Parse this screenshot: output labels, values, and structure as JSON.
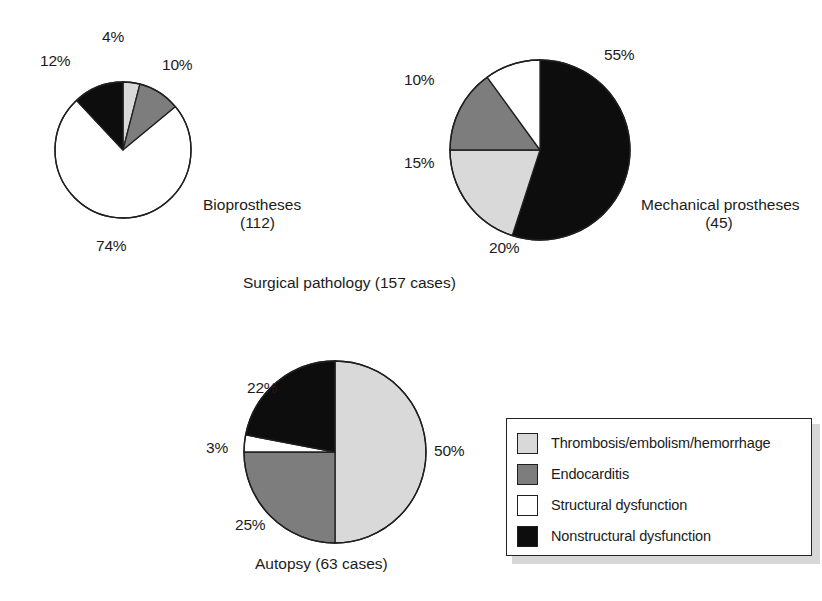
{
  "colors": {
    "thrombosis": "#d9d9d9",
    "endocarditis": "#7d7d7d",
    "structural": "#ffffff",
    "nonstructural": "#0d0d0d",
    "outline": "#1f1f1f",
    "background": "#ffffff",
    "text": "#1b1b1b"
  },
  "legend": {
    "name": "legend",
    "items": [
      {
        "label": "Thrombosis/embolism/hemorrhage",
        "key": "thrombosis",
        "color": "#d9d9d9"
      },
      {
        "label": "Endocarditis",
        "key": "endocarditis",
        "color": "#7d7d7d"
      },
      {
        "label": "Structural dysfunction",
        "key": "structural",
        "color": "#ffffff"
      },
      {
        "label": "Nonstructural dysfunction",
        "key": "nonstructural",
        "color": "#0d0d0d"
      }
    ]
  },
  "captions": {
    "surgical_pathology": "Surgical pathology (157 cases)",
    "autopsy": "Autopsy (63 cases)"
  },
  "pies": {
    "bioprostheses": {
      "title_line1": "Bioprostheses",
      "title_line2": "(112)",
      "labels": [
        "4%",
        "10%",
        "74%",
        "12%"
      ]
    },
    "mechanical": {
      "title_line1": "Mechanical prostheses",
      "title_line2": "(45)",
      "labels": [
        "55%",
        "20%",
        "15%",
        "10%"
      ]
    },
    "autopsy": {
      "title_line1": "Autopsy (63 cases)",
      "title_line2": "",
      "labels": [
        "50%",
        "25%",
        "3%",
        "22%"
      ]
    }
  },
  "chart_data": {
    "type": "pie",
    "title": "",
    "legend_position": "bottom-right",
    "categories": [
      "Thrombosis/embolism/hemorrhage",
      "Endocarditis",
      "Structural dysfunction",
      "Nonstructural dysfunction"
    ],
    "category_colors": [
      "#d9d9d9",
      "#7d7d7d",
      "#ffffff",
      "#0d0d0d"
    ],
    "units": "percent",
    "groups": [
      {
        "name": "Surgical pathology (157 cases)",
        "charts": [
          {
            "name": "Bioprostheses",
            "subtitle": "(112)",
            "n": 112,
            "center": [
              123,
              150
            ],
            "radius": 68,
            "start_angle_deg": 0,
            "direction": "clockwise",
            "slices": [
              {
                "category": "Thrombosis/embolism/hemorrhage",
                "value": 4,
                "label": "4%",
                "color": "#d9d9d9"
              },
              {
                "category": "Endocarditis",
                "value": 10,
                "label": "10%",
                "color": "#7d7d7d"
              },
              {
                "category": "Structural dysfunction",
                "value": 74,
                "label": "74%",
                "color": "#ffffff"
              },
              {
                "category": "Nonstructural dysfunction",
                "value": 12,
                "label": "12%",
                "color": "#0d0d0d"
              }
            ]
          },
          {
            "name": "Mechanical prostheses",
            "subtitle": "(45)",
            "n": 45,
            "center": [
              540,
              150
            ],
            "radius": 90,
            "start_angle_deg": 0,
            "direction": "clockwise",
            "slices": [
              {
                "category": "Nonstructural dysfunction",
                "value": 55,
                "label": "55%",
                "color": "#0d0d0d"
              },
              {
                "category": "Thrombosis/embolism/hemorrhage",
                "value": 20,
                "label": "20%",
                "color": "#d9d9d9"
              },
              {
                "category": "Endocarditis",
                "value": 15,
                "label": "15%",
                "color": "#7d7d7d"
              },
              {
                "category": "Structural dysfunction",
                "value": 10,
                "label": "10%",
                "color": "#ffffff"
              }
            ]
          }
        ]
      },
      {
        "name": "Autopsy (63 cases)",
        "charts": [
          {
            "name": "Autopsy",
            "subtitle": "(63 cases)",
            "n": 63,
            "center": [
              335,
              452
            ],
            "radius": 91,
            "start_angle_deg": 0,
            "direction": "clockwise",
            "slices": [
              {
                "category": "Thrombosis/embolism/hemorrhage",
                "value": 50,
                "label": "50%",
                "color": "#d9d9d9"
              },
              {
                "category": "Endocarditis",
                "value": 25,
                "label": "25%",
                "color": "#7d7d7d"
              },
              {
                "category": "Structural dysfunction",
                "value": 3,
                "label": "3%",
                "color": "#ffffff"
              },
              {
                "category": "Nonstructural dysfunction",
                "value": 22,
                "label": "22%",
                "color": "#0d0d0d"
              }
            ]
          }
        ]
      }
    ]
  }
}
